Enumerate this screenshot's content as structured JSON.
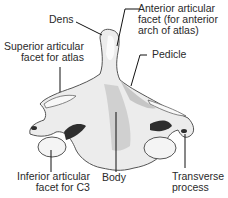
{
  "diagram": {
    "labels": {
      "dens": "Dens",
      "anterior_facet": "Anterior articular\nfacet (for anterior\narch of atlas)",
      "superior_facet": "Superior articular\nfacet for atlas",
      "pedicle": "Pedicle",
      "inferior_facet": "Inferior articular\nfacet for C3",
      "body": "Body",
      "transverse_process": "Transverse\nprocess"
    },
    "colors": {
      "bone_fill": "#ececec",
      "bone_shadow": "#b8b8b8",
      "dark_shadow": "#2e2e2e",
      "outline": "#555555",
      "leader_line": "#111111"
    }
  }
}
